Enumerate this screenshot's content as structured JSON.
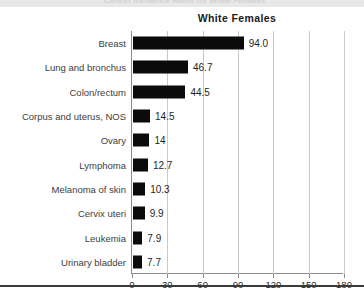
{
  "top_strip": {
    "ghost_text": "Cancer Incidence Rates for White Females"
  },
  "chart_data": {
    "type": "bar",
    "orientation": "horizontal",
    "title": "White Females",
    "xlabel": "",
    "ylabel": "",
    "xlim": [
      0,
      180
    ],
    "xticks": [
      0,
      30,
      60,
      90,
      120,
      150,
      180
    ],
    "xtick_labels": [
      "0",
      "30",
      "60",
      "90",
      "120",
      "150",
      "180"
    ],
    "grid": true,
    "grid_axis": "x",
    "legend": null,
    "bar_color": "#0b0b0b",
    "categories": [
      "Breast",
      "Lung and bronchus",
      "Colon/rectum",
      "Corpus and uterus, NOS",
      "Ovary",
      "Lymphoma",
      "Melanoma of skin",
      "Cervix uteri",
      "Leukemia",
      "Urinary bladder"
    ],
    "values": [
      94.0,
      46.7,
      44.5,
      14.5,
      14,
      12.7,
      10.3,
      9.9,
      7.9,
      7.7
    ],
    "data_labels": [
      "94.0",
      "46.7",
      "44.5",
      "14.5",
      "14",
      "12.7",
      "10.3",
      "9.9",
      "7.9",
      "7.7"
    ]
  }
}
